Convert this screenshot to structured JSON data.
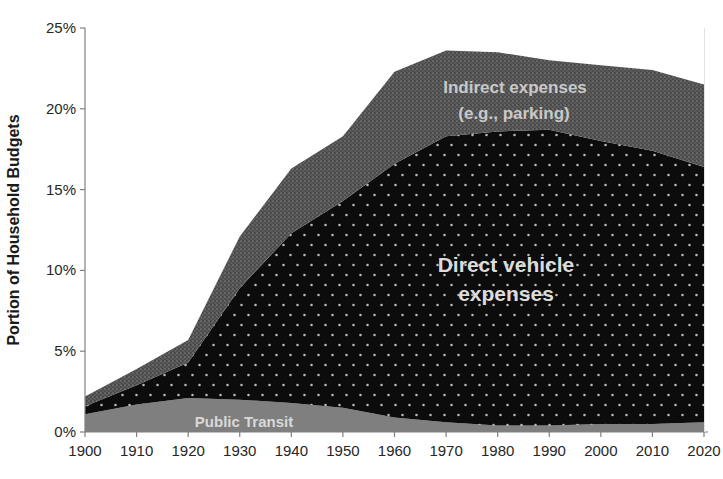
{
  "chart_data": {
    "type": "area",
    "stacked": true,
    "title": "",
    "xlabel": "",
    "ylabel": "Portion of Household Budgets",
    "xlim": [
      1900,
      2020
    ],
    "ylim": [
      0,
      25
    ],
    "grid": false,
    "legend_position": "labels-inside-areas",
    "x": [
      1900,
      1910,
      1920,
      1930,
      1940,
      1950,
      1960,
      1970,
      1980,
      1990,
      2000,
      2010,
      2020
    ],
    "x_tick_labels": [
      "1900",
      "1910",
      "1920",
      "1930",
      "1940",
      "1950",
      "1960",
      "1970",
      "1980",
      "1990",
      "2000",
      "2010",
      "2020"
    ],
    "y_ticks": [
      0,
      5,
      10,
      15,
      20,
      25
    ],
    "y_tick_labels": [
      "0%",
      "5%",
      "10%",
      "15%",
      "20%",
      "25%"
    ],
    "series": [
      {
        "name": "Public Transit",
        "pattern": "solid",
        "color": "#7f7f7f",
        "values": [
          1.1,
          1.7,
          2.1,
          2.0,
          1.8,
          1.5,
          0.9,
          0.6,
          0.4,
          0.4,
          0.5,
          0.5,
          0.6
        ]
      },
      {
        "name": "Direct vehicle expenses",
        "pattern": "white-dots-on-black",
        "color": "#0c0c0c",
        "dot_color": "#b5b5b5",
        "values": [
          0.5,
          1.2,
          2.2,
          6.9,
          10.5,
          12.8,
          15.7,
          17.7,
          18.2,
          18.3,
          17.5,
          16.9,
          15.8
        ]
      },
      {
        "name": "Indirect expenses (e.g., parking)",
        "pattern": "dark-grain",
        "color": "#4e4e4e",
        "grain_light": "#666666",
        "grain_mid": "#5a5a5a",
        "grain_dark": "#3e3e3e",
        "values": [
          0.6,
          1.0,
          1.4,
          3.2,
          4.0,
          4.0,
          5.7,
          5.3,
          4.9,
          4.3,
          4.7,
          5.0,
          5.1
        ]
      }
    ],
    "area_labels": {
      "indirect_line1": "Indirect expenses",
      "indirect_line2": "(e.g., parking)",
      "direct_line1": "Direct vehicle",
      "direct_line2": "expenses",
      "transit": "Public Transit"
    },
    "axis_color": "#808080",
    "plot_right_border_color": "#e3e3e3"
  }
}
